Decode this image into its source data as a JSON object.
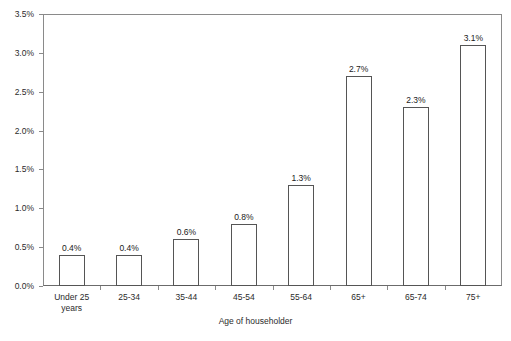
{
  "chart_data": {
    "type": "bar",
    "title": "",
    "xlabel": "Age of householder",
    "ylabel": "",
    "categories": [
      "Under 25\nyears",
      "25-34",
      "35-44",
      "45-54",
      "55-64",
      "65+",
      "65-74",
      "75+"
    ],
    "values": [
      0.4,
      0.4,
      0.6,
      0.8,
      1.3,
      2.7,
      2.3,
      3.1
    ],
    "data_labels": [
      "0.4%",
      "0.4%",
      "0.6%",
      "0.8%",
      "1.3%",
      "2.7%",
      "2.3%",
      "3.1%"
    ],
    "ylim": [
      0.0,
      3.5
    ],
    "ytick_values": [
      0.0,
      0.5,
      1.0,
      1.5,
      2.0,
      2.5,
      3.0,
      3.5
    ],
    "ytick_labels": [
      "0.0%",
      "0.5%",
      "1.0%",
      "1.5%",
      "2.0%",
      "2.5%",
      "3.0%",
      "3.5%"
    ],
    "grid": false,
    "legend": null,
    "legend_position": "none",
    "bar_fill_color": "#ffffff",
    "bar_border_color": "#555555",
    "axis_color": "#8a8a8a",
    "text_color": "#2b2b2b",
    "background_color": "#ffffff"
  }
}
